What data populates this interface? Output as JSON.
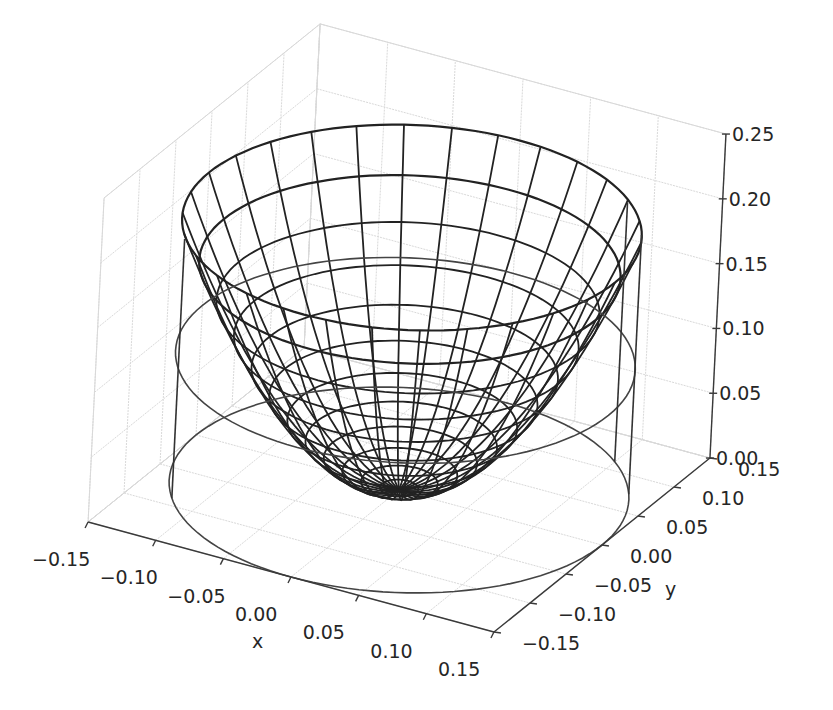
{
  "chart_data": {
    "type": "3d-wireframe",
    "title": "",
    "xlabel": "x",
    "ylabel": "y",
    "zlabel": "",
    "xlim": [
      -0.15,
      0.15
    ],
    "ylim": [
      -0.15,
      0.15
    ],
    "zlim": [
      0.0,
      0.25
    ],
    "x_ticks": [
      "−0.15",
      "−0.10",
      "−0.05",
      "0.00",
      "0.05",
      "0.10",
      "0.15"
    ],
    "y_ticks": [
      "−0.15",
      "−0.10",
      "−0.05",
      "0.00",
      "0.05",
      "0.10",
      "0.15"
    ],
    "z_ticks": [
      "0.00",
      "0.05",
      "0.10",
      "0.15",
      "0.20",
      "0.25"
    ],
    "x_tick_values": [
      -0.15,
      -0.1,
      -0.05,
      0.0,
      0.05,
      0.1,
      0.15
    ],
    "y_tick_values": [
      -0.15,
      -0.1,
      -0.05,
      0.0,
      0.05,
      0.1,
      0.15
    ],
    "z_tick_values": [
      0.0,
      0.05,
      0.1,
      0.15,
      0.2,
      0.25
    ],
    "grid": true,
    "legend": null,
    "series": [
      {
        "name": "paraboloid surface",
        "kind": "wireframe",
        "equation": "z = 9.0 * (x^2 + y^2)",
        "coefficient": 9.0,
        "r_max": 0.15,
        "radial_rings": 12,
        "angular_spokes": 30,
        "color": "#222222"
      },
      {
        "name": "cylinder",
        "kind": "cylinder",
        "radius": 0.15,
        "z_bottom": 0.0,
        "z_top": 0.1,
        "color": "#333333"
      }
    ]
  },
  "colors": {
    "background": "#ffffff",
    "pane_grid": "#d9d9d9",
    "axis_line": "#3a3a3a",
    "text": "#262626",
    "wire": "#222222"
  }
}
